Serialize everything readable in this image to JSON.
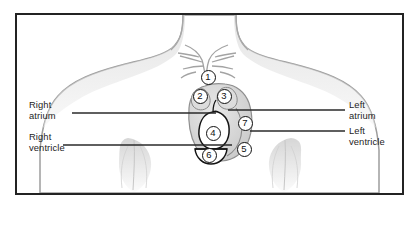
{
  "figure": {
    "type": "anatomical-diagram",
    "background_color": "#ffffff",
    "border_color": "#232323",
    "line_color": "#2a2a2a",
    "body_outline_color": "#9a9a9a",
    "heart_outline_color": "#1a1a1a"
  },
  "labels": [
    {
      "id": "right-atrium",
      "text": "Right\natrium",
      "side": "left",
      "x": 29,
      "y": 100,
      "leader": {
        "x1": 72,
        "x2": 216,
        "y": 113
      }
    },
    {
      "id": "right-ventricle",
      "text": "Right\nventricle",
      "side": "left",
      "x": 29,
      "y": 132,
      "leader": {
        "x1": 63,
        "x2": 232,
        "y": 145
      }
    },
    {
      "id": "left-atrium",
      "text": "Left\natrium",
      "side": "right",
      "x": 349,
      "y": 100,
      "leader": {
        "x1": 228,
        "x2": 345,
        "y": 110
      }
    },
    {
      "id": "left-ventricle",
      "text": "Left\nventricle",
      "side": "right",
      "x": 349,
      "y": 126,
      "leader": {
        "x1": 250,
        "x2": 345,
        "y": 131
      }
    }
  ],
  "callouts": [
    {
      "number": "1",
      "x": 208,
      "y": 77
    },
    {
      "number": "2",
      "x": 200,
      "y": 96
    },
    {
      "number": "3",
      "x": 224,
      "y": 96
    },
    {
      "number": "4",
      "x": 213,
      "y": 133
    },
    {
      "number": "5",
      "x": 244,
      "y": 149
    },
    {
      "number": "6",
      "x": 209,
      "y": 155
    },
    {
      "number": "7",
      "x": 245,
      "y": 123
    }
  ]
}
